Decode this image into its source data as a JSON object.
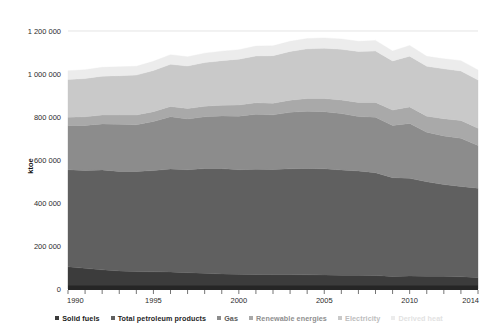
{
  "chart_data": {
    "type": "area",
    "stacked": true,
    "title": "",
    "xlabel": "",
    "ylabel": "ktoe",
    "ylim": [
      0,
      1200000
    ],
    "xlim": [
      1990,
      2014
    ],
    "grid": true,
    "legend_position": "bottom",
    "y_ticks": [
      0,
      200000,
      400000,
      600000,
      800000,
      1000000,
      1200000
    ],
    "y_tick_labels": [
      "0",
      "200 000",
      "400 000",
      "600 000",
      "800 000",
      "1 000 000",
      "1 200 000"
    ],
    "x_ticks": [
      1990,
      1995,
      2000,
      2005,
      2010,
      2014
    ],
    "x_tick_labels": [
      "1990",
      "1995",
      "2000",
      "2005",
      "2010",
      "2014"
    ],
    "x": [
      1990,
      1991,
      1992,
      1993,
      1994,
      1995,
      1996,
      1997,
      1998,
      1999,
      2000,
      2001,
      2002,
      2003,
      2004,
      2005,
      2006,
      2007,
      2008,
      2009,
      2010,
      2011,
      2012,
      2013,
      2014
    ],
    "series": [
      {
        "name": "Solid fuels",
        "color": "#3c3c3c",
        "values": [
          103000,
          96000,
          89000,
          84000,
          81000,
          80000,
          79000,
          76000,
          73000,
          70000,
          69000,
          68000,
          67000,
          67000,
          66000,
          65000,
          64000,
          64000,
          63000,
          58000,
          60000,
          59000,
          59000,
          57000,
          54000
        ]
      },
      {
        "name": "Total petroleum products",
        "color": "#606060",
        "values": [
          452000,
          455000,
          465000,
          463000,
          466000,
          471000,
          479000,
          479000,
          487000,
          490000,
          486000,
          489000,
          489000,
          492000,
          495000,
          494000,
          490000,
          485000,
          478000,
          460000,
          455000,
          440000,
          427000,
          420000,
          415000
        ]
      },
      {
        "name": "Gas",
        "color": "#8c8c8c",
        "values": [
          205000,
          210000,
          214000,
          219000,
          217000,
          228000,
          243000,
          236000,
          241000,
          245000,
          249000,
          256000,
          254000,
          263000,
          266000,
          266000,
          262000,
          253000,
          258000,
          243000,
          255000,
          230000,
          226000,
          224000,
          199000
        ]
      },
      {
        "name": "Renewable energies",
        "color": "#a9a9a9",
        "values": [
          39000,
          40000,
          41000,
          43000,
          45000,
          46000,
          48000,
          48000,
          49000,
          50000,
          52000,
          53000,
          54000,
          56000,
          59000,
          61000,
          63000,
          66000,
          69000,
          71000,
          77000,
          75000,
          80000,
          83000,
          80000
        ]
      },
      {
        "name": "Electricity",
        "color": "#c9c9c9",
        "values": [
          175000,
          178000,
          181000,
          183000,
          186000,
          191000,
          196000,
          198000,
          203000,
          207000,
          213000,
          218000,
          221000,
          227000,
          231000,
          234000,
          236000,
          237000,
          239000,
          229000,
          236000,
          232000,
          232000,
          230000,
          224000
        ]
      },
      {
        "name": "Derived heat",
        "color": "#ececec",
        "values": [
          41000,
          41000,
          41000,
          42000,
          41000,
          43000,
          45000,
          43000,
          44000,
          44000,
          44000,
          46000,
          46000,
          47000,
          48000,
          48000,
          48000,
          47000,
          49000,
          46000,
          50000,
          46000,
          47000,
          48000,
          47000
        ]
      }
    ],
    "totals": [
      1015000,
      1020000,
      1031000,
      1034000,
      1036000,
      1059000,
      1090000,
      1080000,
      1097000,
      1106000,
      1113000,
      1130000,
      1131000,
      1152000,
      1165000,
      1168000,
      1163000,
      1152000,
      1156000,
      1107000,
      1133000,
      1082000,
      1071000,
      1062000,
      1019000
    ]
  },
  "legend": {
    "items": [
      {
        "label": "Solid fuels",
        "color": "#3c3c3c",
        "text_color": "#1a1a1a"
      },
      {
        "label": "Total petroleum products",
        "color": "#606060",
        "text_color": "#1f1f1f"
      },
      {
        "label": "Gas",
        "color": "#8c8c8c",
        "text_color": "#5a5a5a"
      },
      {
        "label": "Renewable energies",
        "color": "#a9a9a9",
        "text_color": "#8e8e8e"
      },
      {
        "label": "Electricity",
        "color": "#c9c9c9",
        "text_color": "#bdbdbd"
      },
      {
        "label": "Derived heat",
        "color": "#ececec",
        "text_color": "#e2e2e2"
      }
    ]
  },
  "axes": {
    "y_title": "ktoe"
  }
}
